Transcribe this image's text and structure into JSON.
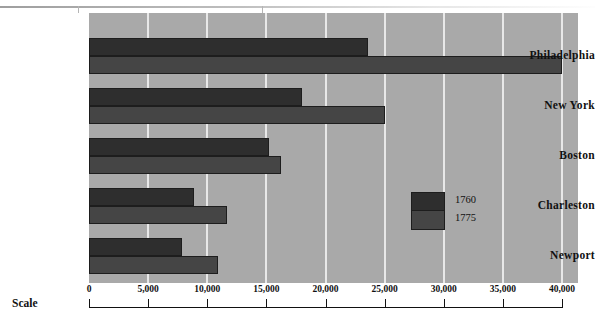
{
  "chart_data": {
    "type": "bar",
    "orientation": "horizontal",
    "title": "",
    "xlabel": "Scale",
    "ylabel": "",
    "categories": [
      "Philadelphia",
      "New York",
      "Boston",
      "Charleston",
      "Newport"
    ],
    "series": [
      {
        "name": "1760",
        "color": "#2e2e2e",
        "values": [
          23600,
          18000,
          15200,
          8900,
          7900
        ]
      },
      {
        "name": "1775",
        "color": "#454545",
        "values": [
          40000,
          25000,
          16200,
          11700,
          10900
        ]
      }
    ],
    "xlim": [
      0,
      40000
    ],
    "xticks": [
      0,
      5000,
      10000,
      15000,
      20000,
      25000,
      30000,
      35000,
      40000
    ],
    "xtick_labels": [
      "0",
      "5,000",
      "10,000",
      "15,000",
      "20,000",
      "25,000",
      "30,000",
      "35,000",
      "40,000"
    ],
    "grid": true,
    "grid_color": "#e8e8e8",
    "plot_background": "#a9a9a9",
    "legend": {
      "position": "inside-right",
      "entries": [
        "1760",
        "1775"
      ]
    }
  },
  "axis": {
    "scale_label": "Scale"
  }
}
